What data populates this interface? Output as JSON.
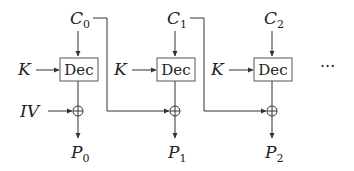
{
  "diagram": {
    "key_label": "K",
    "iv_label": "IV",
    "block_label": "Dec",
    "ellipsis": "···",
    "columns": [
      {
        "ciphertext": "C",
        "ciphertext_sub": "0",
        "plaintext": "P",
        "plaintext_sub": "0"
      },
      {
        "ciphertext": "C",
        "ciphertext_sub": "1",
        "plaintext": "P",
        "plaintext_sub": "1"
      },
      {
        "ciphertext": "C",
        "ciphertext_sub": "2",
        "plaintext": "P",
        "plaintext_sub": "2"
      }
    ],
    "colors": {
      "line": "#333333",
      "box_fill": "#ffffff"
    }
  }
}
